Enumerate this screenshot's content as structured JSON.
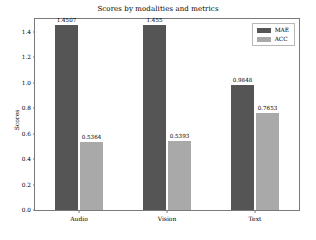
{
  "chart_data": {
    "type": "bar",
    "title": "Scores by modalities and metrics",
    "xlabel": "",
    "ylabel": "Scores",
    "categories": [
      "Audio",
      "Vision",
      "Text"
    ],
    "series": [
      {
        "name": "MAE",
        "color": "#555555",
        "values": [
          1.4507,
          1.455,
          0.9848
        ],
        "labels": [
          "1.4507",
          "1.455",
          "0.9848"
        ]
      },
      {
        "name": "ACC",
        "color": "#a9a9a9",
        "values": [
          0.5364,
          0.5393,
          0.7653
        ],
        "labels": [
          "0.5364",
          "0.5393",
          "0.7653"
        ]
      }
    ],
    "ylim": [
      0.0,
      1.5
    ],
    "yticks": [
      "0.0",
      "0.2",
      "0.4",
      "0.6",
      "0.8",
      "1.0",
      "1.2",
      "1.4"
    ],
    "ytick_values": [
      0.0,
      0.2,
      0.4,
      0.6,
      0.8,
      1.0,
      1.2,
      1.4
    ],
    "grid": false,
    "legend_position": "top-right",
    "legend_entries": [
      "MAE",
      "ACC"
    ]
  }
}
